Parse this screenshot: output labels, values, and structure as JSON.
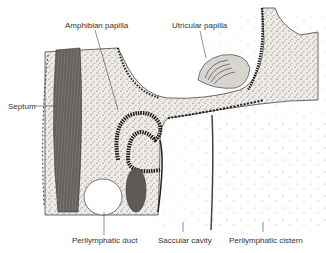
{
  "figure": {
    "labels": {
      "amphibian_papilla": "Amphibian papilla",
      "utricular_papilla": "Utricular papilla",
      "septum": "Septum",
      "perilymphatic_duct": "Perilymphatic duct",
      "saccular_cavity": "Saccular cavity",
      "perilymphatic_cistern": "Perilymphatic cistern"
    },
    "colors": {
      "background": "#ffffff",
      "tissue_fill": "#ece9e4",
      "septum_fill": "#6e6a66",
      "epithelium": "#222222",
      "stipple": "#888888"
    }
  }
}
